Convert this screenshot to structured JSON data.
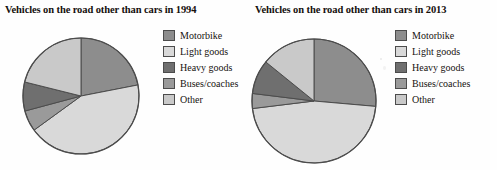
{
  "figure": {
    "background_color": "#fefefe",
    "panel_count": 2
  },
  "palette": {
    "motorbike": "#8d8d8d",
    "light_goods": "#d9d9d9",
    "heavy_goods": "#7a7a7a",
    "buses_coaches": "#9a9a9a",
    "other": "#c9c9c9",
    "outline": "#4c4c4c",
    "text": "#17120f"
  },
  "legend": {
    "items": [
      {
        "label": "Motorbike",
        "color": "#8d8d8d",
        "swatch_name": "legend-swatch-motorbike"
      },
      {
        "label": "Light goods",
        "color": "#d9d9d9",
        "swatch_name": "legend-swatch-light-goods"
      },
      {
        "label": "Heavy goods",
        "color": "#6f6f6f",
        "swatch_name": "legend-swatch-heavy-goods"
      },
      {
        "label": "Buses/coaches",
        "color": "#9a9a9a",
        "swatch_name": "legend-swatch-buses-coaches"
      },
      {
        "label": "Other",
        "color": "#c9c9c9",
        "swatch_name": "legend-swatch-other"
      }
    ]
  },
  "chart_data": [
    {
      "type": "pie",
      "title": "Vehicles on the road other than cars in 1994",
      "xlabel": "",
      "ylabel": "",
      "legend_position": "right",
      "grid": false,
      "start_angle_deg": 0,
      "direction": "clockwise",
      "categories": [
        "Motorbike",
        "Light goods",
        "Buses/coaches",
        "Heavy goods",
        "Other"
      ],
      "values": [
        22,
        43,
        6,
        8,
        21
      ],
      "slice_angles_deg": [
        79,
        155,
        21,
        29,
        76
      ],
      "colors": [
        "#8d8d8d",
        "#d9d9d9",
        "#9a9a9a",
        "#6f6f6f",
        "#c9c9c9"
      ],
      "center_px": [
        80,
        95
      ],
      "radius_px": 58
    },
    {
      "type": "pie",
      "title": "Vehicles on the road other than cars in 2013",
      "xlabel": "",
      "ylabel": "",
      "legend_position": "right",
      "grid": false,
      "start_angle_deg": 0,
      "direction": "clockwise",
      "categories": [
        "Motorbike",
        "Light goods",
        "Buses/coaches",
        "Heavy goods",
        "Other"
      ],
      "values": [
        26,
        47,
        4,
        9,
        14
      ],
      "slice_angles_deg": [
        95,
        168,
        14,
        32,
        51
      ],
      "colors": [
        "#8d8d8d",
        "#d9d9d9",
        "#9a9a9a",
        "#6f6f6f",
        "#c9c9c9"
      ],
      "center_px": [
        313,
        100
      ],
      "radius_px": 62
    }
  ]
}
